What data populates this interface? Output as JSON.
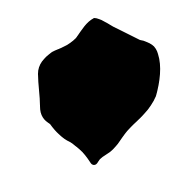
{
  "grid": {
    "columns": [
      "1",
      "2",
      "3",
      "4",
      "5"
    ],
    "rows": [
      "G",
      "F",
      "E",
      "D",
      "C",
      "B",
      "A"
    ],
    "line_color": "#d6d6d6",
    "region_fill": "#c4c4c4",
    "region_stroke": "#6e6e6e"
  },
  "points": [
    {
      "row": "G",
      "col": 3,
      "value": "1"
    },
    {
      "row": "F",
      "col": 2,
      "value": "2"
    },
    {
      "row": "F",
      "col": 3,
      "value": "8"
    },
    {
      "row": "F",
      "col": 4,
      "value": "5"
    },
    {
      "row": "F",
      "col": 5,
      "value": "2"
    },
    {
      "row": "E",
      "col": 1,
      "value": "2"
    },
    {
      "row": "E",
      "col": 2,
      "value": "12"
    },
    {
      "row": "E",
      "col": 3,
      "value": "15"
    },
    {
      "row": "E",
      "col": 4,
      "value": "10"
    },
    {
      "row": "E",
      "col": 5,
      "value": "2"
    },
    {
      "row": "D",
      "col": 1,
      "value": "2"
    },
    {
      "row": "D",
      "col": 2,
      "value": "10"
    },
    {
      "row": "D",
      "col": 3,
      "value": "18"
    },
    {
      "row": "D",
      "col": 4,
      "value": "12"
    },
    {
      "row": "D",
      "col": 5,
      "value": "2"
    },
    {
      "row": "C",
      "col": 1,
      "value": "2"
    },
    {
      "row": "C",
      "col": 2,
      "value": "16"
    },
    {
      "row": "C",
      "col": 3,
      "value": "20"
    },
    {
      "row": "C",
      "col": 4,
      "value": "5"
    },
    {
      "row": "B",
      "col": 2,
      "value": "2"
    },
    {
      "row": "B",
      "col": 3,
      "value": "10"
    },
    {
      "row": "B",
      "col": 4,
      "value": "1"
    },
    {
      "row": "A",
      "col": 3,
      "value": "8"
    }
  ]
}
